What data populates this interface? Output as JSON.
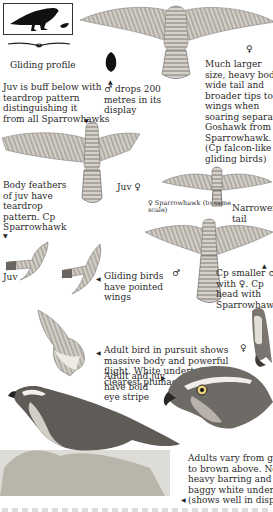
{
  "plate": {
    "labels": {
      "gliding_profile": "Gliding profile",
      "juv_buff": [
        "Juv is buff below with",
        "teardrop pattern",
        "distinguishing it",
        "from all Sparrowhawks"
      ],
      "male_drops": [
        "♂ drops 200",
        "metres in its",
        "display"
      ],
      "much_larger": [
        "Much larger",
        "size, heavy body,",
        "wide tail and",
        "broader tips to",
        "wings when",
        "soaring separates",
        "Goshawk from",
        "Sparrowhawk.",
        "(Cp falcon-like",
        "gliding birds)"
      ],
      "female_top": "♀",
      "body_feathers": [
        "Body feathers",
        "of juv have",
        "teardrop",
        "pattern. Cp",
        "Sparrowhawk"
      ],
      "juv_female": "Juv ♀",
      "sparrowhawk_scale": [
        "♀ Sparrowhawk (to same",
        "scale)"
      ],
      "narrower_tail": [
        "Narrower",
        "tail"
      ],
      "juv": "Juv",
      "gliding_pointed": [
        "Gliding birds",
        "have pointed",
        "wings"
      ],
      "male_mid": "♂",
      "cp_smaller": [
        "Cp smaller ♂",
        "with ♀. Cp",
        "head with",
        "Sparrowhawk"
      ],
      "adult_pursuit": [
        "Adult bird in pursuit shows",
        "massive body and powerful",
        "flight. White undertail is",
        "clearest plumage feature"
      ],
      "female_perched": "♀",
      "eye_stripe": [
        "Adult and juv",
        "have bold",
        "eye stripe"
      ],
      "adults_vary": [
        "Adults vary from grey",
        "to brown above. Note",
        "heavy barring and",
        "baggy white undertail",
        "(shows well in display)"
      ]
    },
    "colors": {
      "ink": "#222222",
      "feather_light": "#cfcac2",
      "feather_mid": "#8f8a84",
      "feather_dark": "#4a4744",
      "grass": "#9a9a8e",
      "silhouette": "#111111"
    }
  }
}
